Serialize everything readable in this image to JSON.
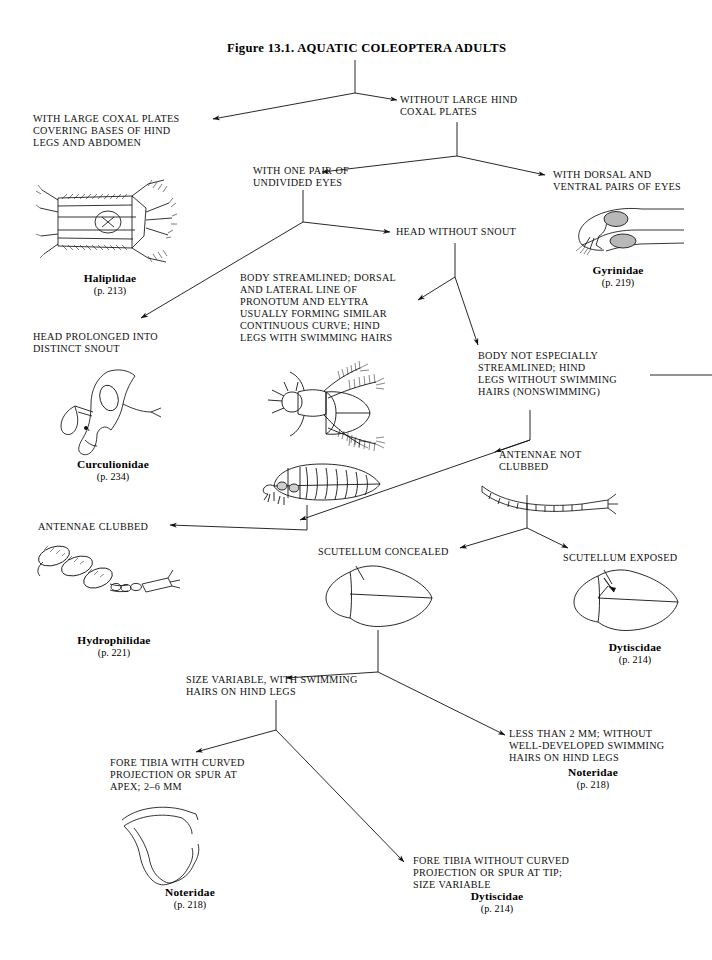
{
  "figure": {
    "title": "Figure 13.1.  AQUATIC COLEOPTERA ADULTS"
  },
  "couplets": [
    {
      "id": "with-large-coxal-plates",
      "text": "WITH LARGE COXAL PLATES\nCOVERING BASES OF HIND\nLEGS AND ABDOMEN"
    },
    {
      "id": "without-large-hind-coxal-plates",
      "text": "WITHOUT LARGE HIND\nCOXAL PLATES"
    },
    {
      "id": "with-one-pair-of-undivided-eyes",
      "text": "WITH ONE PAIR OF\nUNDIVIDED EYES"
    },
    {
      "id": "with-dorsal-and-ventral-pairs-of-eyes",
      "text": "WITH DORSAL AND\nVENTRAL PAIRS OF EYES"
    },
    {
      "id": "head-without-snout",
      "text": "HEAD WITHOUT SNOUT"
    },
    {
      "id": "head-prolonged-into-distinct-snout",
      "text": "HEAD PROLONGED INTO\nDISTINCT SNOUT"
    },
    {
      "id": "body-streamlined",
      "text": "BODY STREAMLINED; DORSAL\nAND LATERAL LINE OF\nPRONOTUM AND ELYTRA\nUSUALLY FORMING SIMILAR\nCONTINUOUS CURVE; HIND\nLEGS WITH SWIMMING HAIRS"
    },
    {
      "id": "body-not-especially-streamlined",
      "text": "BODY NOT ESPECIALLY\nSTREAMLINED; HIND\nLEGS WITHOUT SWIMMING\nHAIRS (NONSWIMMING)"
    },
    {
      "id": "antennae-not-clubbed",
      "text": "ANTENNAE NOT\nCLUBBED"
    },
    {
      "id": "antennae-clubbed",
      "text": "ANTENNAE CLUBBED"
    },
    {
      "id": "scutellum-concealed",
      "text": "SCUTELLUM CONCEALED"
    },
    {
      "id": "scutellum-exposed",
      "text": "SCUTELLUM EXPOSED"
    },
    {
      "id": "size-variable-with-swimming-hairs",
      "text": "SIZE VARIABLE, WITH SWIMMING\nHAIRS ON HIND LEGS"
    },
    {
      "id": "less-than-2-mm",
      "text": "LESS THAN 2 MM; WITHOUT\nWELL-DEVELOPED SWIMMING\nHAIRS ON HIND LEGS"
    },
    {
      "id": "fore-tibia-with-curved-projection",
      "text": "FORE TIBIA WITH CURVED\nPROJECTION OR SPUR AT\nAPEX; 2–6 MM"
    },
    {
      "id": "fore-tibia-without-curved-projection",
      "text": "FORE TIBIA WITHOUT CURVED\nPROJECTION OR SPUR AT TIP;\nSIZE VARIABLE"
    }
  ],
  "taxa": [
    {
      "id": "haliplidae",
      "name": "Haliplidae",
      "page": "(p. 213)"
    },
    {
      "id": "gyrinidae",
      "name": "Gyrinidae",
      "page": "(p. 219)"
    },
    {
      "id": "curculionidae",
      "name": "Curculionidae",
      "page": "(p. 234)"
    },
    {
      "id": "hydrophilidae",
      "name": "Hydrophilidae",
      "page": "(p. 221)"
    },
    {
      "id": "dytiscidae-scutellum",
      "name": "Dytiscidae",
      "page": "(p. 214)"
    },
    {
      "id": "noteridae-less-than-2mm",
      "name": "Noteridae",
      "page": "(p. 218)"
    },
    {
      "id": "noteridae-fore-tibia",
      "name": "Noteridae",
      "page": "(p. 218)"
    },
    {
      "id": "dytiscidae-fore-tibia",
      "name": "Dytiscidae",
      "page": "(p. 214)"
    }
  ],
  "illustrations": [
    {
      "id": "haliplidae-illustration",
      "label": "haliplid-beetle-ventral-drawing"
    },
    {
      "id": "gyrinidae-illustration",
      "label": "gyrinid-head-lateral-drawing"
    },
    {
      "id": "curculionidae-illustration",
      "label": "weevil-head-snout-drawing"
    },
    {
      "id": "dytiscid-dorsal-illustration",
      "label": "streamlined-beetle-dorsal-drawing"
    },
    {
      "id": "dytiscid-lateral-illustration",
      "label": "streamlined-beetle-lateral-drawing"
    },
    {
      "id": "antenna-filiform-illustration",
      "label": "filiform-antenna-drawing"
    },
    {
      "id": "antenna-clubbed-illustration",
      "label": "clubbed-antenna-drawing"
    },
    {
      "id": "scutellum-concealed-illustration",
      "label": "beetle-outline-scutellum-concealed-drawing"
    },
    {
      "id": "scutellum-exposed-illustration",
      "label": "beetle-outline-scutellum-exposed-drawing"
    },
    {
      "id": "fore-tibia-illustration",
      "label": "fore-tibia-curved-spur-drawing"
    }
  ]
}
